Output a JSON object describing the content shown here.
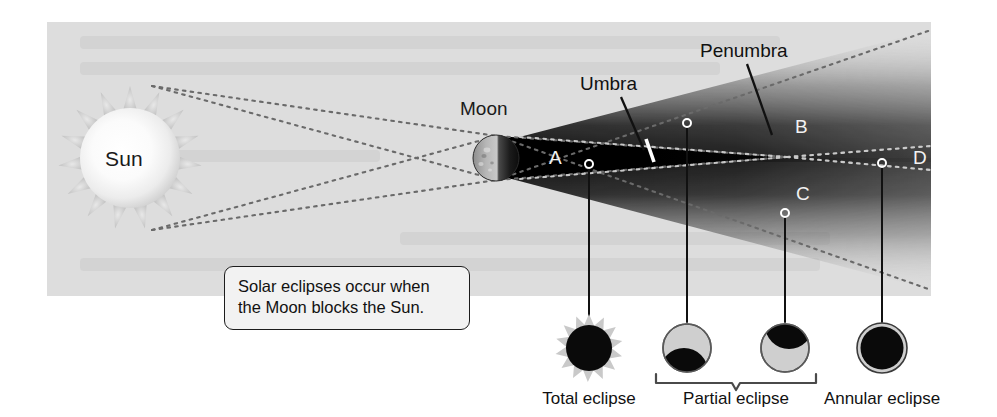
{
  "figure": {
    "background_color": "#ffffff",
    "panel_color": "#dddddd"
  },
  "bodies": {
    "sun_label": "Sun",
    "moon_label": "Moon"
  },
  "shadow_labels": {
    "umbra": "Umbra",
    "penumbra": "Penumbra"
  },
  "zones": [
    {
      "id": "A",
      "label": "A"
    },
    {
      "id": "B",
      "label": "B"
    },
    {
      "id": "C",
      "label": "C"
    },
    {
      "id": "D",
      "label": "D"
    }
  ],
  "caption": {
    "line1": "Solar eclipses occur when",
    "line2": "the Moon blocks the Sun."
  },
  "legend": [
    {
      "id": "total",
      "label": "Total eclipse",
      "icon": "total-eclipse-icon"
    },
    {
      "id": "partial-a",
      "label": "",
      "icon": "partial-eclipse-icon-lower"
    },
    {
      "id": "partial-b",
      "label": "",
      "icon": "partial-eclipse-icon-upper"
    },
    {
      "id": "partial-group",
      "label": "Partial eclipse",
      "icon": "partial-eclipse-bracket"
    },
    {
      "id": "annular",
      "label": "Annular eclipse",
      "icon": "annular-eclipse-icon"
    }
  ],
  "colors": {
    "panel": "#dddddd",
    "shadow_dark": "#000000",
    "ink": "#111111",
    "light_text": "#f2f2f2",
    "icon_light": "#cfcfcf",
    "icon_dark": "#0a0a0a"
  }
}
